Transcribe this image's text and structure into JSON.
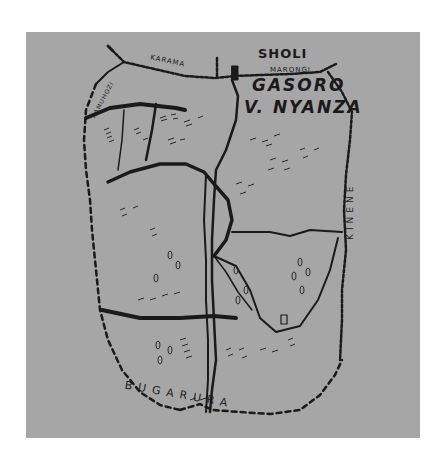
{
  "map": {
    "title": "GASORO V. NYANZA",
    "style": "hand-drawn sketch map",
    "background_color": "#a6a6a6",
    "ink_color": "#1a1a1a",
    "labels": {
      "north": "SHOLI",
      "title_line1": "GASORO",
      "title_line2": "V. NYANZA",
      "north_border_west": "KARAMA",
      "north_border_east": "MARONGI",
      "east": "KINENE",
      "south": "BUGARURA",
      "northwest": "KAMUHOZI"
    },
    "legend_features": [
      "dashed-line: boundary",
      "thick-line: road",
      "tree-symbols: vegetation",
      "hatch-marks: cultivated fields",
      "enclosed-loop: lowland/marsh area",
      "square: building"
    ]
  }
}
